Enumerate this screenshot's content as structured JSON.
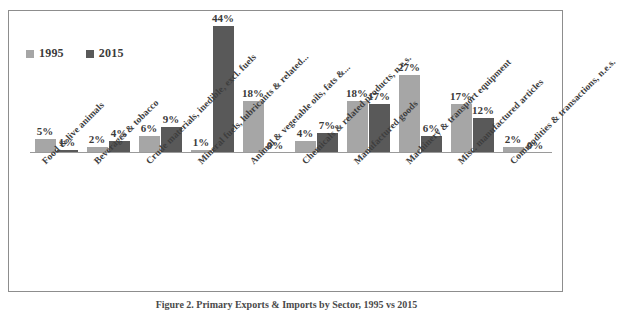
{
  "figure": {
    "caption": "Figure 2. Primary Exports & Imports by Sector, 1995 vs 2015",
    "border_color": "#8d8d8d",
    "background": "#ffffff"
  },
  "legend": {
    "position": "top-left",
    "entries": [
      {
        "label": "1995",
        "color": "#a6a6a6"
      },
      {
        "label": "2015",
        "color": "#595959"
      }
    ]
  },
  "chart_data": {
    "type": "bar",
    "title": "",
    "subtitle": "",
    "xlabel": "",
    "ylabel": "",
    "ylim": [
      0,
      48
    ],
    "grid": false,
    "legend_position": "top-left",
    "value_suffix": "%",
    "categories": [
      "Food & live animals",
      "Beverages & tobacco",
      "Crude materials, inedible, excl. fuels",
      "Mineral fuels, lubricants & related...",
      "Animal & vegetable oils, fats &...",
      "Chemicals & related products, n.e.s.",
      "Manufactured goods",
      "Machinery & transport equipment",
      "Misc. manufactured articles",
      "Commodities & transactions, n.e.s."
    ],
    "series": [
      {
        "name": "1995",
        "color": "#a6a6a6",
        "values": [
          5,
          2,
          6,
          1,
          18,
          4,
          18,
          27,
          17,
          2
        ],
        "labels": [
          "5%",
          "2%",
          "6%",
          "1%",
          "18%",
          "4%",
          "18%",
          "27%",
          "17%",
          "2%"
        ]
      },
      {
        "name": "2015",
        "color": "#595959",
        "values": [
          1,
          4,
          9,
          44,
          0,
          7,
          17,
          6,
          12,
          0
        ],
        "labels": [
          "1%",
          "4%",
          "9%",
          "44%",
          "0%",
          "7%",
          "17%",
          "6%",
          "12%",
          "0%"
        ]
      }
    ]
  }
}
